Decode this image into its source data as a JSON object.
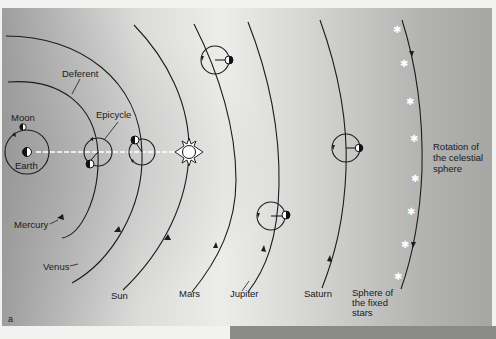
{
  "figure": {
    "panel_label": "a",
    "background_gradient": [
      "#9a9a9a",
      "#e6e6e4",
      "#a8a8a8"
    ],
    "line_color": "#1c1c1c",
    "star_color": "#ffffff"
  },
  "labels": {
    "deferent": "Deferent",
    "epicycle": "Epicycle",
    "moon": "Moon",
    "earth": "Earth",
    "mercury": "Mercury",
    "venus": "Venus",
    "sun": "Sun",
    "mars": "Mars",
    "jupiter": "Jupiter",
    "saturn": "Saturn",
    "sphere_fixed_stars": [
      "Sphere of",
      "the fixed",
      "stars"
    ],
    "rotation_celestial": [
      "Rotation of",
      "the celestial",
      "sphere"
    ]
  },
  "bodies": [
    {
      "name": "Earth",
      "cx": 27,
      "cy": 152
    },
    {
      "name": "Moon",
      "cx": 23,
      "cy": 127
    },
    {
      "name": "Mercury epicycle",
      "cx": 98,
      "cy": 152,
      "r": 14
    },
    {
      "name": "Venus epicycle",
      "cx": 142,
      "cy": 152,
      "r": 13
    },
    {
      "name": "Sun",
      "cx": 189,
      "cy": 152
    },
    {
      "name": "Mars epicycle",
      "cx": 215,
      "cy": 60,
      "r": 14
    },
    {
      "name": "Jupiter epicycle",
      "cx": 271,
      "cy": 216,
      "r": 14
    },
    {
      "name": "Saturn epicycle",
      "cx": 346,
      "cy": 148,
      "r": 14
    }
  ],
  "stars_count": 8
}
